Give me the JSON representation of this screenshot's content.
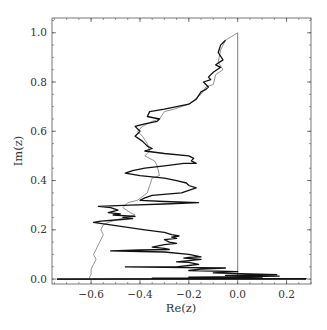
{
  "chart_data": {
    "type": "line",
    "title": "",
    "xlabel": "Re(z)",
    "ylabel": "Im(z)",
    "xlim": [
      -0.76,
      0.3
    ],
    "ylim": [
      -0.02,
      1.06
    ],
    "grid": false,
    "legend": null,
    "x_ticks": [
      -0.6,
      -0.4,
      -0.2,
      0.0,
      0.2
    ],
    "x_tick_labels": [
      "−0.6",
      "−0.4",
      "−0.2",
      "0.0",
      "0.2"
    ],
    "y_ticks": [
      0.0,
      0.2,
      0.4,
      0.6,
      0.8,
      1.0
    ],
    "y_tick_labels": [
      "0.0",
      "0.2",
      "0.4",
      "0.6",
      "0.8",
      "1.0"
    ],
    "x_minor_step": 0.05,
    "y_minor_step": 0.05,
    "reference_lines": [
      {
        "orientation": "vertical",
        "x": 0.0,
        "y_range": [
          0.0,
          1.0
        ],
        "color": "#555555"
      },
      {
        "orientation": "horizontal",
        "y": 0.0,
        "x_range": [
          -0.74,
          0.28
        ],
        "color": "#000000"
      }
    ],
    "series": [
      {
        "name": "path-gray",
        "color": "#777777",
        "width": 0.8,
        "points": [
          [
            0.0,
            1.0
          ],
          [
            -0.05,
            0.97
          ],
          [
            -0.07,
            0.93
          ],
          [
            -0.08,
            0.88
          ],
          [
            -0.06,
            0.85
          ],
          [
            -0.09,
            0.83
          ],
          [
            -0.1,
            0.79
          ],
          [
            -0.13,
            0.78
          ],
          [
            -0.15,
            0.75
          ],
          [
            -0.2,
            0.71
          ],
          [
            -0.26,
            0.69
          ],
          [
            -0.3,
            0.68
          ],
          [
            -0.32,
            0.65
          ],
          [
            -0.35,
            0.64
          ],
          [
            -0.39,
            0.62
          ],
          [
            -0.41,
            0.6
          ],
          [
            -0.39,
            0.58
          ],
          [
            -0.37,
            0.55
          ],
          [
            -0.36,
            0.52
          ],
          [
            -0.38,
            0.5
          ],
          [
            -0.34,
            0.48
          ],
          [
            -0.33,
            0.46
          ],
          [
            -0.32,
            0.42
          ],
          [
            -0.35,
            0.41
          ],
          [
            -0.36,
            0.38
          ],
          [
            -0.37,
            0.35
          ],
          [
            -0.41,
            0.32
          ],
          [
            -0.45,
            0.31
          ],
          [
            -0.47,
            0.29
          ],
          [
            -0.44,
            0.27
          ],
          [
            -0.42,
            0.26
          ],
          [
            -0.46,
            0.25
          ],
          [
            -0.5,
            0.24
          ],
          [
            -0.53,
            0.23
          ],
          [
            -0.55,
            0.22
          ],
          [
            -0.56,
            0.2
          ],
          [
            -0.55,
            0.18
          ],
          [
            -0.56,
            0.16
          ],
          [
            -0.57,
            0.14
          ],
          [
            -0.58,
            0.12
          ],
          [
            -0.59,
            0.1
          ],
          [
            -0.58,
            0.08
          ],
          [
            -0.59,
            0.06
          ],
          [
            -0.6,
            0.04
          ],
          [
            -0.6,
            0.02
          ],
          [
            -0.61,
            0.0
          ]
        ]
      },
      {
        "name": "path-black",
        "color": "#111111",
        "width": 1.3,
        "points": [
          [
            -0.05,
            0.97
          ],
          [
            -0.07,
            0.95
          ],
          [
            -0.08,
            0.92
          ],
          [
            -0.06,
            0.89
          ],
          [
            -0.09,
            0.87
          ],
          [
            -0.07,
            0.86
          ],
          [
            -0.1,
            0.84
          ],
          [
            -0.12,
            0.82
          ],
          [
            -0.11,
            0.81
          ],
          [
            -0.14,
            0.8
          ],
          [
            -0.12,
            0.78
          ],
          [
            -0.13,
            0.77
          ],
          [
            -0.15,
            0.76
          ],
          [
            -0.17,
            0.73
          ],
          [
            -0.2,
            0.71
          ],
          [
            -0.25,
            0.7
          ],
          [
            -0.3,
            0.69
          ],
          [
            -0.36,
            0.68
          ],
          [
            -0.37,
            0.66
          ],
          [
            -0.32,
            0.65
          ],
          [
            -0.33,
            0.64
          ],
          [
            -0.38,
            0.63
          ],
          [
            -0.42,
            0.62
          ],
          [
            -0.4,
            0.6
          ],
          [
            -0.42,
            0.58
          ],
          [
            -0.39,
            0.56
          ],
          [
            -0.37,
            0.54
          ],
          [
            -0.35,
            0.53
          ],
          [
            -0.38,
            0.52
          ],
          [
            -0.3,
            0.51
          ],
          [
            -0.2,
            0.5
          ],
          [
            -0.18,
            0.49
          ],
          [
            -0.19,
            0.48
          ],
          [
            -0.17,
            0.47
          ],
          [
            -0.22,
            0.47
          ],
          [
            -0.3,
            0.46
          ],
          [
            -0.38,
            0.45
          ],
          [
            -0.43,
            0.44
          ],
          [
            -0.46,
            0.43
          ],
          [
            -0.4,
            0.42
          ],
          [
            -0.3,
            0.41
          ],
          [
            -0.25,
            0.4
          ],
          [
            -0.21,
            0.39
          ],
          [
            -0.2,
            0.38
          ],
          [
            -0.17,
            0.37
          ],
          [
            -0.2,
            0.36
          ],
          [
            -0.23,
            0.35
          ],
          [
            -0.35,
            0.34
          ],
          [
            -0.38,
            0.33
          ],
          [
            -0.4,
            0.32
          ],
          [
            -0.3,
            0.315
          ],
          [
            -0.16,
            0.31
          ],
          [
            -0.3,
            0.305
          ],
          [
            -0.44,
            0.3
          ],
          [
            -0.57,
            0.295
          ],
          [
            -0.52,
            0.29
          ],
          [
            -0.49,
            0.28
          ],
          [
            -0.53,
            0.27
          ],
          [
            -0.48,
            0.265
          ],
          [
            -0.51,
            0.26
          ],
          [
            -0.42,
            0.255
          ],
          [
            -0.47,
            0.25
          ],
          [
            -0.43,
            0.245
          ],
          [
            -0.5,
            0.24
          ],
          [
            -0.56,
            0.235
          ],
          [
            -0.59,
            0.23
          ],
          [
            -0.52,
            0.22
          ],
          [
            -0.45,
            0.21
          ],
          [
            -0.38,
            0.2
          ],
          [
            -0.3,
            0.19
          ],
          [
            -0.27,
            0.18
          ],
          [
            -0.24,
            0.175
          ],
          [
            -0.27,
            0.17
          ],
          [
            -0.25,
            0.165
          ],
          [
            -0.3,
            0.16
          ],
          [
            -0.28,
            0.15
          ],
          [
            -0.25,
            0.145
          ],
          [
            -0.3,
            0.14
          ],
          [
            -0.35,
            0.13
          ],
          [
            -0.3,
            0.125
          ],
          [
            -0.28,
            0.12
          ],
          [
            -0.4,
            0.118
          ],
          [
            -0.52,
            0.115
          ],
          [
            -0.4,
            0.112
          ],
          [
            -0.3,
            0.11
          ],
          [
            -0.2,
            0.1
          ],
          [
            -0.15,
            0.09
          ],
          [
            -0.2,
            0.088
          ],
          [
            -0.22,
            0.085
          ],
          [
            -0.15,
            0.08
          ],
          [
            -0.25,
            0.07
          ],
          [
            -0.2,
            0.068
          ],
          [
            -0.16,
            0.06
          ],
          [
            -0.2,
            0.055
          ],
          [
            -0.25,
            0.05
          ],
          [
            -0.46,
            0.05
          ],
          [
            -0.3,
            0.048
          ],
          [
            -0.05,
            0.045
          ],
          [
            -0.15,
            0.04
          ],
          [
            -0.2,
            0.035
          ],
          [
            0.0,
            0.03
          ],
          [
            -0.1,
            0.025
          ],
          [
            0.16,
            0.018
          ],
          [
            -0.05,
            0.015
          ],
          [
            0.17,
            0.012
          ],
          [
            0.05,
            0.01
          ],
          [
            -0.2,
            0.008
          ],
          [
            0.1,
            0.006
          ],
          [
            -0.35,
            0.004
          ],
          [
            0.28,
            0.002
          ],
          [
            -0.46,
            0.001
          ],
          [
            -0.74,
            0.0
          ]
        ]
      }
    ]
  }
}
